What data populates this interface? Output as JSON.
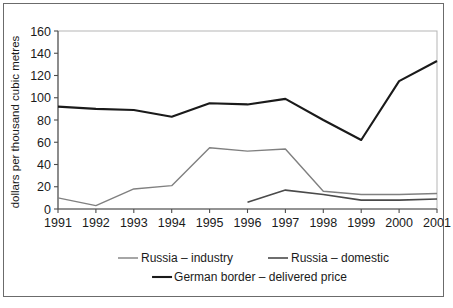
{
  "chart_data": {
    "type": "line",
    "title": "",
    "xlabel": "",
    "ylabel": "dollars per thousand cubic metres",
    "x": [
      1991,
      1992,
      1993,
      1994,
      1995,
      1996,
      1997,
      1998,
      1999,
      2000,
      2001
    ],
    "xtick_labels": [
      "1991",
      "1992",
      "1993",
      "1994",
      "1995",
      "1996",
      "1997",
      "1998",
      "1999",
      "2000",
      "2001"
    ],
    "ytick_labels": [
      "0",
      "20",
      "40",
      "60",
      "80",
      "100",
      "120",
      "140",
      "160"
    ],
    "yticks": [
      0,
      20,
      40,
      60,
      80,
      100,
      120,
      140,
      160
    ],
    "ylim": [
      0,
      160
    ],
    "xlim": [
      1991,
      2001
    ],
    "grid": false,
    "legend_position": "bottom",
    "series": [
      {
        "name": "Russia – industry",
        "color": "#808080",
        "width": 1.4,
        "x": [
          1991,
          1992,
          1993,
          1994,
          1995,
          1996,
          1997,
          1998,
          1999,
          2000,
          2001
        ],
        "values": [
          10,
          3,
          18,
          21,
          55,
          52,
          54,
          16,
          13,
          13,
          14
        ]
      },
      {
        "name": "Russia – domestic",
        "color": "#4a4a4a",
        "width": 1.6,
        "x": [
          1996,
          1997,
          1998,
          1999,
          2000,
          2001
        ],
        "values": [
          6,
          17,
          13,
          8,
          8,
          9
        ]
      },
      {
        "name": "German border – delivered price",
        "color": "#1a1a1a",
        "width": 2.1,
        "x": [
          1991,
          1992,
          1993,
          1994,
          1995,
          1996,
          1997,
          1998,
          1999,
          2000,
          2001
        ],
        "values": [
          92,
          90,
          89,
          83,
          95,
          94,
          99,
          80,
          62,
          115,
          133
        ]
      }
    ]
  },
  "legend": {
    "items": [
      {
        "label": "Russia – industry",
        "color": "#808080",
        "width": 1.4
      },
      {
        "label": "Russia – domestic",
        "color": "#4a4a4a",
        "width": 1.6
      },
      {
        "label": "German border – delivered price",
        "color": "#1a1a1a",
        "width": 2.1
      }
    ]
  }
}
